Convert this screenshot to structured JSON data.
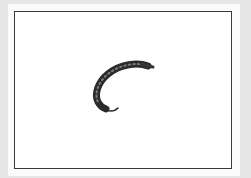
{
  "image": {
    "subject": "fishing-fly",
    "description": "Curved nymph fishing fly with segmented dark body on a hook, centered in a framed white panel",
    "colors": {
      "background": "#e6e6e6",
      "panel": "#fbfbfb",
      "frame_border": "#3a3a3a",
      "fly_body": "#2b2b2b",
      "fly_segment": "#6a6a6a"
    }
  }
}
